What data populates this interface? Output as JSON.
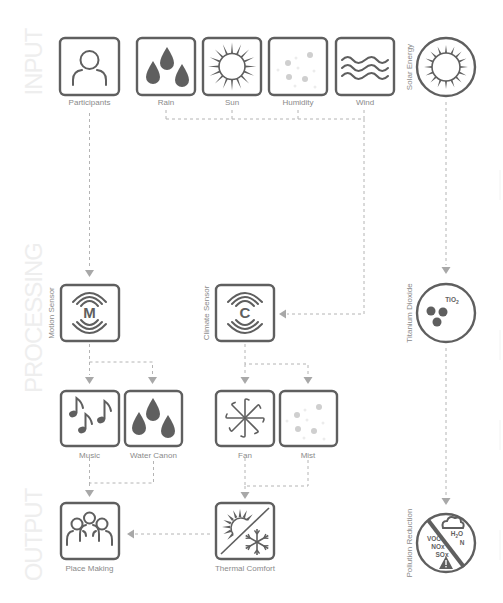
{
  "sections": {
    "input": "INPUT",
    "processing": "PROCESSING",
    "output": "OUTPUT"
  },
  "nodes": {
    "participants": {
      "label": "Participants",
      "icon": "person-icon"
    },
    "rain": {
      "label": "Rain",
      "icon": "raindrops-icon"
    },
    "sun": {
      "label": "Sun",
      "icon": "sun-icon"
    },
    "humidity": {
      "label": "Humidity",
      "icon": "mist-dots-icon"
    },
    "wind": {
      "label": "Wind",
      "icon": "wind-waves-icon"
    },
    "solar_energy": {
      "label": "Solar Energy",
      "icon": "sun-circle-icon"
    },
    "motion_sensor": {
      "label": "Motion Sensor",
      "icon": "motion-sensor-icon",
      "letter": "M"
    },
    "climate_sensor": {
      "label": "Climate Sensor",
      "icon": "climate-sensor-icon",
      "letter": "C"
    },
    "titanium_dioxide": {
      "label": "Titanium Dioxide",
      "icon": "molecule-icon",
      "formula": "TiO",
      "formula_sub": "2"
    },
    "music": {
      "label": "Music",
      "icon": "music-notes-icon"
    },
    "water_canon": {
      "label": "Water Canon",
      "icon": "raindrops-icon"
    },
    "fan": {
      "label": "Fan",
      "icon": "fan-icon"
    },
    "mist": {
      "label": "Mist",
      "icon": "mist-dots-icon"
    },
    "place_making": {
      "label": "Place Making",
      "icon": "group-icon"
    },
    "thermal_comfort": {
      "label": "Thermal Comfort",
      "icon": "sun-snowflake-icon"
    },
    "pollution_reduction": {
      "label": "Pollution Reduction",
      "icon": "pollution-reduction-icon",
      "pollutants": [
        "VOC",
        "NOx",
        "SOx"
      ],
      "products": [
        "H",
        "2",
        "O",
        "N"
      ]
    }
  },
  "edges": [
    {
      "from": "participants",
      "to": "motion_sensor"
    },
    {
      "from": "rain",
      "to": "climate_sensor"
    },
    {
      "from": "sun",
      "to": "climate_sensor"
    },
    {
      "from": "humidity",
      "to": "climate_sensor"
    },
    {
      "from": "wind",
      "to": "climate_sensor"
    },
    {
      "from": "solar_energy",
      "to": "titanium_dioxide"
    },
    {
      "from": "motion_sensor",
      "to": "music"
    },
    {
      "from": "motion_sensor",
      "to": "water_canon"
    },
    {
      "from": "climate_sensor",
      "to": "fan"
    },
    {
      "from": "climate_sensor",
      "to": "mist"
    },
    {
      "from": "music",
      "to": "place_making"
    },
    {
      "from": "water_canon",
      "to": "place_making"
    },
    {
      "from": "fan",
      "to": "thermal_comfort"
    },
    {
      "from": "mist",
      "to": "thermal_comfort"
    },
    {
      "from": "thermal_comfort",
      "to": "place_making"
    },
    {
      "from": "titanium_dioxide",
      "to": "pollution_reduction"
    }
  ],
  "colors": {
    "icon": "#5f5f5f",
    "connector": "#b4b4b4",
    "label": "#8a8a8a",
    "section_text": "#eeeeee"
  }
}
